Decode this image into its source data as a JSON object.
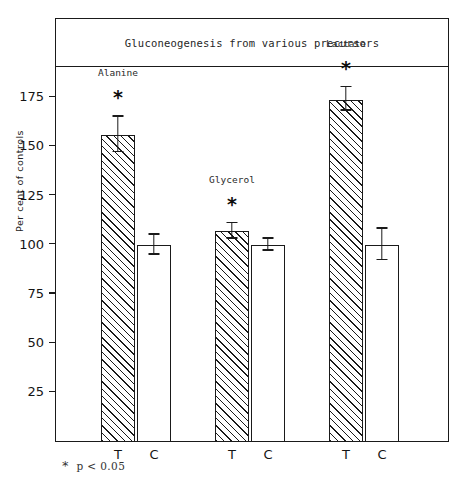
{
  "chart_data": {
    "type": "bar",
    "title": "Gluconeogenesis from various precursors",
    "xlabel": "",
    "ylabel": "Per cent of controls",
    "ylim": [
      0,
      190
    ],
    "yticks": [
      25,
      50,
      75,
      100,
      125,
      150,
      175
    ],
    "ytick_labels": [
      "25",
      "50",
      "75",
      "100",
      "125",
      "150",
      "175"
    ],
    "grid": false,
    "legend": "none",
    "categories": [
      "Alanine",
      "Glycerol",
      "Lactate"
    ],
    "x_tick_labels": [
      "T",
      "C",
      "T",
      "C",
      "T",
      "C"
    ],
    "series": [
      {
        "name": "T",
        "label": "T",
        "fill": "hatched",
        "values": [
          156,
          107,
          174
        ],
        "errors": [
          9,
          4,
          6
        ],
        "significance": [
          "*",
          "*",
          "*"
        ]
      },
      {
        "name": "C",
        "label": "C",
        "fill": "white",
        "values": [
          100,
          100,
          100
        ],
        "errors": [
          5,
          3,
          8
        ],
        "significance": [
          "",
          "",
          ""
        ]
      }
    ],
    "groups": [
      {
        "label": "Alanine",
        "significance_marker": "*",
        "bars": [
          {
            "x_label": "T",
            "value": 156,
            "error": 9,
            "fill": "hatched"
          },
          {
            "x_label": "C",
            "value": 100,
            "error": 5,
            "fill": "white"
          }
        ]
      },
      {
        "label": "Glycerol",
        "significance_marker": "*",
        "bars": [
          {
            "x_label": "T",
            "value": 107,
            "error": 4,
            "fill": "hatched"
          },
          {
            "x_label": "C",
            "value": 100,
            "error": 3,
            "fill": "white"
          }
        ]
      },
      {
        "label": "Lactate",
        "significance_marker": "*",
        "bars": [
          {
            "x_label": "T",
            "value": 174,
            "error": 6,
            "fill": "hatched"
          },
          {
            "x_label": "C",
            "value": 100,
            "error": 8,
            "fill": "white"
          }
        ]
      }
    ],
    "footnote": {
      "marker": "*",
      "text": "p < 0.05"
    },
    "colors": {
      "axis": "#1a1a1a",
      "bar_outline": "#1a1a1a",
      "hatch": "#1a1a1a",
      "background": "#ffffff"
    }
  }
}
